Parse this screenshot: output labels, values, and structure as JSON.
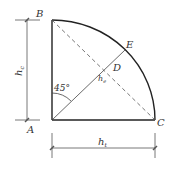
{
  "diagram": {
    "points": {
      "A": "A",
      "B": "B",
      "C": "C",
      "D": "D",
      "E": "E"
    },
    "angle_label": "45°",
    "dimension_left": "h",
    "dimension_left_sub": "c",
    "dimension_bottom": "h",
    "dimension_bottom_sub": "t",
    "diagonal_label": "h",
    "diagonal_label_sub": "e",
    "colors": {
      "line": "#222222",
      "dim": "#555555"
    }
  }
}
